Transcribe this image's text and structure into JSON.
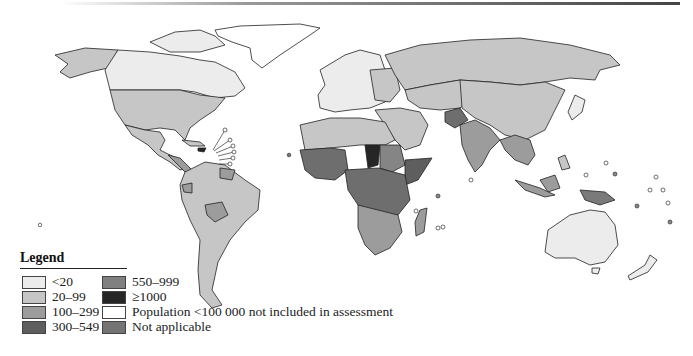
{
  "map": {
    "title": "",
    "description": "World map of maternal mortality ratio categories by country",
    "colors": {
      "lt20": "#ececec",
      "20_99": "#c6c6c6",
      "100_299": "#9c9c9c",
      "300_549": "#6e6e6e",
      "550_999": "#858585",
      "ge1000": "#262626",
      "small_pop": "#ffffff",
      "not_applicable": "#7a7a7a",
      "border": "#222222"
    }
  },
  "legend": {
    "title": "Legend",
    "items": [
      {
        "label": "<20",
        "color": "#ececec"
      },
      {
        "label": "20–99",
        "color": "#c6c6c6"
      },
      {
        "label": "100–299",
        "color": "#9c9c9c"
      },
      {
        "label": "300–549",
        "color": "#5e5e5e"
      },
      {
        "label": "550–999",
        "color": "#808080"
      },
      {
        "label": "≥1000",
        "color": "#262626"
      },
      {
        "label": "Population <100 000 not included in assessment",
        "color": "#ffffff"
      },
      {
        "label": "Not applicable",
        "color": "#747474"
      }
    ]
  }
}
